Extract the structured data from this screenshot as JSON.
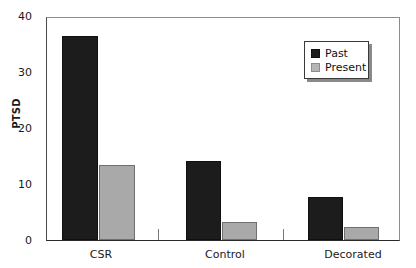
{
  "chart_data": {
    "type": "bar",
    "title": "",
    "xlabel": "",
    "ylabel": "PTSD",
    "categories": [
      "CSR",
      "Control",
      "Decorated"
    ],
    "series": [
      {
        "name": "Past",
        "color": "#1c1c1c",
        "values": [
          36.7,
          14.3,
          7.8
        ]
      },
      {
        "name": "Present",
        "color": "#a9a9a9",
        "values": [
          13.6,
          3.2,
          2.3
        ]
      }
    ],
    "ylim": [
      0,
      40
    ],
    "yticks": [
      "0",
      "10",
      "20",
      "30",
      "40"
    ],
    "ytick_values": [
      0,
      10,
      20,
      30,
      40
    ],
    "grid": false,
    "legend_position": "top-right"
  },
  "legend": {
    "entries": [
      {
        "label": "Past"
      },
      {
        "label": "Present"
      }
    ]
  }
}
